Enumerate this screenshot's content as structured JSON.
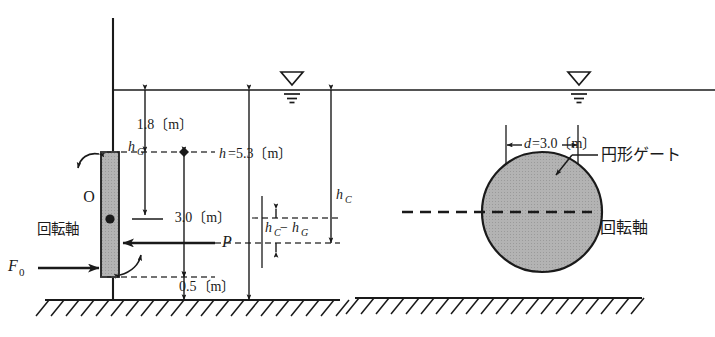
{
  "figure": {
    "title": "",
    "type": "engineering-diagram"
  },
  "colors": {
    "line": "#1a1a1a",
    "gate_fill": "#b3b3b3",
    "gate_stroke": "#1a1a1a",
    "dash": "#555555",
    "background": "#ffffff"
  },
  "left_view": {
    "name": "side-elevation",
    "labels": {
      "depth_to_gate_top": "1.8",
      "depth_to_gate_top_unit": "〔m〕",
      "depth_to_gate_top_full": "1.8〔m〕",
      "total_depth": "h=5.3〔m〕",
      "total_depth_symbol": "h",
      "total_depth_value": "=5.3〔m〕",
      "gate_height": "3.0",
      "gate_height_unit": "〔m〕",
      "gate_height_full": "3.0〔m〕",
      "bottom_clearance": "0.5",
      "bottom_clearance_unit": "〔m〕",
      "bottom_clearance_full": "0.5〔m〕",
      "h_G_symbol": "h",
      "h_G_sub": "G",
      "h_C_symbol": "h",
      "h_C_sub": "C",
      "hc_minus_hg_1": "h",
      "hc_minus_hg_sub1": "C",
      "hc_minus_hg_op": "−",
      "hc_minus_hg_2": "h",
      "hc_minus_hg_sub2": "G",
      "pivot_point": "O",
      "rotation_axis": "回転軸",
      "force_P": "P",
      "force_F0_symbol": "F",
      "force_F0_sub": "0"
    }
  },
  "right_view": {
    "name": "front-elevation",
    "labels": {
      "diameter_symbol": "d",
      "diameter_value": "=3.0〔m〕",
      "diameter_full": "d=3.0〔m〕",
      "gate_name": "円形ゲート",
      "gate_name_leader": "—",
      "rotation_axis": "回転軸"
    }
  },
  "symbols": {
    "water_surface_left": "water-level-triangle",
    "water_surface_right": "water-level-triangle",
    "ground_hatch": "hatched-ground-line"
  }
}
